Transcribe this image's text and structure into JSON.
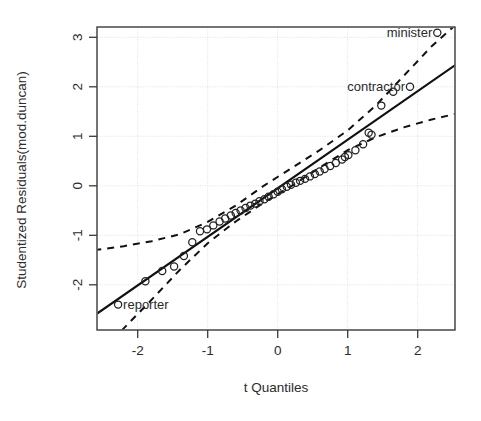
{
  "figure": {
    "kind": "qq-plot",
    "background": "#ffffff",
    "foreground": "#1a1a1a"
  },
  "chart_data": {
    "type": "scatter",
    "title": "",
    "subtitle": "",
    "xlabel": "t Quantiles",
    "ylabel": "Studentized Residuals(mod.duncan)",
    "xlim": [
      -2.62,
      2.62
    ],
    "ylim": [
      -2.72,
      3.35
    ],
    "xticks": [
      -2,
      -1,
      0,
      1,
      2
    ],
    "xticklabels": [
      "-2",
      "-1",
      "0",
      "1",
      "2"
    ],
    "yticks": [
      -2,
      -1,
      0,
      1,
      2,
      3
    ],
    "yticklabels": [
      "-2",
      "-1",
      "0",
      "1",
      "2",
      "3"
    ],
    "grid": true,
    "grid_color": "#d9d9d9",
    "legend": "none",
    "marker": "open-circle",
    "point_color": "#222222",
    "series": [
      {
        "name": "Studentized residuals",
        "x": [
          -2.28,
          -1.89,
          -1.65,
          -1.48,
          -1.34,
          -1.22,
          -1.11,
          -1.01,
          -0.92,
          -0.83,
          -0.75,
          -0.67,
          -0.6,
          -0.53,
          -0.46,
          -0.39,
          -0.32,
          -0.26,
          -0.19,
          -0.13,
          -0.06,
          0.0,
          0.06,
          0.13,
          0.19,
          0.26,
          0.32,
          0.39,
          0.46,
          0.53,
          0.6,
          0.67,
          0.75,
          0.83,
          0.92,
          1.01,
          1.11,
          1.22,
          1.34,
          1.48,
          1.65,
          1.89,
          2.28,
          0.96,
          1.3
        ],
        "y": [
          -2.4,
          -1.93,
          -1.72,
          -1.63,
          -1.42,
          -1.14,
          -0.92,
          -0.88,
          -0.8,
          -0.72,
          -0.66,
          -0.6,
          -0.55,
          -0.5,
          -0.45,
          -0.4,
          -0.36,
          -0.31,
          -0.27,
          -0.22,
          -0.17,
          -0.12,
          -0.07,
          -0.02,
          0.02,
          0.06,
          0.1,
          0.14,
          0.19,
          0.24,
          0.29,
          0.34,
          0.4,
          0.46,
          0.53,
          0.62,
          0.72,
          0.84,
          1.03,
          1.62,
          1.9,
          2.0,
          3.09,
          0.58,
          1.07
        ]
      }
    ],
    "reference_line": {
      "style": "solid",
      "color": "#111111",
      "x": [
        -2.62,
        2.62
      ],
      "y": [
        -2.62,
        2.52
      ]
    },
    "confidence_envelope": {
      "style": "dashed",
      "color": "#111111",
      "upper": {
        "x": [
          -2.62,
          -2.2,
          -1.8,
          -1.4,
          -1.0,
          -0.6,
          -0.2,
          0.2,
          0.6,
          1.0,
          1.4,
          1.8,
          2.2,
          2.62
        ],
        "y": [
          -1.3,
          -1.22,
          -1.12,
          -0.98,
          -0.73,
          -0.4,
          0.0,
          0.36,
          0.72,
          1.12,
          1.62,
          2.22,
          2.82,
          3.35
        ]
      },
      "lower": {
        "x": [
          -2.62,
          -2.2,
          -1.8,
          -1.4,
          -1.0,
          -0.6,
          -0.2,
          0.2,
          0.6,
          1.0,
          1.4,
          1.8,
          2.2,
          2.62
        ],
        "y": [
          -3.48,
          -2.88,
          -2.3,
          -1.7,
          -1.16,
          -0.72,
          -0.34,
          0.0,
          0.37,
          0.72,
          0.98,
          1.18,
          1.34,
          1.48
        ]
      }
    },
    "annotations": [
      {
        "text": "minister",
        "point_x": 2.28,
        "point_y": 3.09,
        "anchor": "right"
      },
      {
        "text": "contractor",
        "point_x": 1.89,
        "point_y": 2.0,
        "anchor": "right"
      },
      {
        "text": "reporter",
        "point_x": -2.28,
        "point_y": -2.4,
        "anchor": "left"
      }
    ]
  }
}
